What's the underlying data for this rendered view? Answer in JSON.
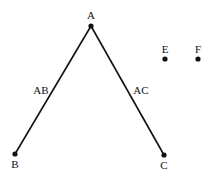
{
  "diagram": {
    "colors": {
      "stroke": "#111111",
      "background": "#ffffff"
    },
    "nodes": [
      {
        "id": "A",
        "label": "A",
        "x": 91,
        "y": 26
      },
      {
        "id": "B",
        "label": "B",
        "x": 15,
        "y": 154
      },
      {
        "id": "C",
        "label": "C",
        "x": 164,
        "y": 155
      },
      {
        "id": "E",
        "label": "E",
        "x": 165,
        "y": 59
      },
      {
        "id": "F",
        "label": "F",
        "x": 198,
        "y": 59
      }
    ],
    "edges": [
      {
        "from": "A",
        "to": "B",
        "label": "AB"
      },
      {
        "from": "A",
        "to": "C",
        "label": "AC"
      }
    ]
  }
}
